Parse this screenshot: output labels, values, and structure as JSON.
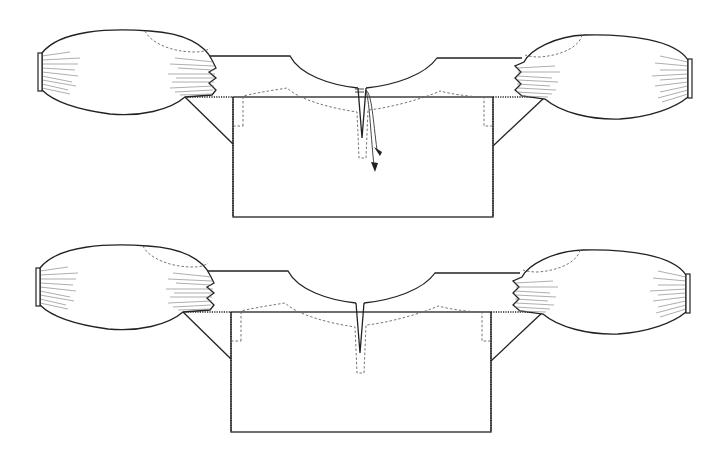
{
  "figure": {
    "variants": [
      {
        "id": "top",
        "label": "Blouse with neck slit and tasseled ties",
        "features": [
          "gathered-sleeves",
          "underarm-gussets",
          "neck-slit",
          "tie-cords-with-tassels",
          "dashed-yoke-embroidery"
        ]
      },
      {
        "id": "bottom",
        "label": "Blouse with plain neck slit",
        "features": [
          "gathered-sleeves",
          "underarm-gussets",
          "neck-slit",
          "dashed-yoke-embroidery"
        ]
      }
    ]
  },
  "colors": {
    "line": "#222222",
    "dashed": "#666666",
    "background": "#ffffff"
  }
}
